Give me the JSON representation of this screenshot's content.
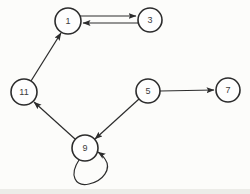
{
  "diagram": {
    "type": "directed-graph",
    "colors": {
      "background": "#fcfcfa",
      "stroke": "#2c2c2c",
      "node_fill": "#fefefe",
      "label": "#3c3c3c",
      "scan_band": "#d9d9d3"
    },
    "nodes": [
      {
        "id": "1",
        "label": "1",
        "x": 68,
        "y": 21,
        "r": 13
      },
      {
        "id": "3",
        "label": "3",
        "x": 150,
        "y": 20,
        "r": 12
      },
      {
        "id": "11",
        "label": "11",
        "x": 24,
        "y": 92,
        "r": 13
      },
      {
        "id": "5",
        "label": "5",
        "x": 148,
        "y": 91,
        "r": 12
      },
      {
        "id": "7",
        "label": "7",
        "x": 228,
        "y": 90,
        "r": 12
      },
      {
        "id": "9",
        "label": "9",
        "x": 85,
        "y": 148,
        "r": 13
      }
    ],
    "edges": [
      {
        "from": "1",
        "to": "3",
        "kind": "line",
        "x1": 80,
        "y1": 16,
        "x2": 136,
        "y2": 16
      },
      {
        "from": "3",
        "to": "1",
        "kind": "line",
        "x1": 138,
        "y1": 23,
        "x2": 83,
        "y2": 23
      },
      {
        "from": "11",
        "to": "1",
        "kind": "line",
        "x1": 31,
        "y1": 81,
        "x2": 61,
        "y2": 33
      },
      {
        "from": "5",
        "to": "7",
        "kind": "line",
        "x1": 160,
        "y1": 91,
        "x2": 214,
        "y2": 90
      },
      {
        "from": "5",
        "to": "9",
        "kind": "line",
        "x1": 139,
        "y1": 99,
        "x2": 95,
        "y2": 139
      },
      {
        "from": "9",
        "to": "11",
        "kind": "line",
        "x1": 75,
        "y1": 139,
        "x2": 34,
        "y2": 102
      },
      {
        "from": "9",
        "to": "9",
        "kind": "loop",
        "path": "M 79 160 C 69 175 75 187 89 184 C 103 181 112 169 105 159 C 103 156 101 154 98 152"
      }
    ]
  }
}
